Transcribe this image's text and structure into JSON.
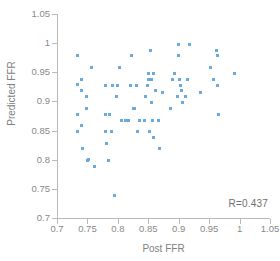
{
  "chart_data": {
    "type": "scatter",
    "title": "",
    "xlabel": "Post FFR",
    "ylabel": "Predicted FFR",
    "xlim": [
      0.7,
      1.05
    ],
    "ylim": [
      0.7,
      1.05
    ],
    "xticks": [
      "0.7",
      "0.75",
      "0.8",
      "0.85",
      "0.9",
      "0.95",
      "1",
      "1.05"
    ],
    "yticks": [
      "0.7",
      "0.75",
      "0.8",
      "0.85",
      "0.9",
      "0.95",
      "1",
      "1.05"
    ],
    "xtick_values": [
      0.7,
      0.75,
      0.8,
      0.85,
      0.9,
      0.95,
      1.0,
      1.05
    ],
    "ytick_values": [
      0.7,
      0.75,
      0.8,
      0.85,
      0.9,
      0.95,
      1.0,
      1.05
    ],
    "grid": false,
    "legend": null,
    "marker_color": "#6aabdd",
    "marker_shape": "square",
    "annotations": [
      {
        "text": "R=0.437",
        "position": "bottom-right"
      }
    ],
    "correlation_r": 0.437,
    "n_points": 84,
    "points": [
      [
        0.733,
        0.978
      ],
      [
        0.733,
        0.929
      ],
      [
        0.733,
        0.878
      ],
      [
        0.733,
        0.849
      ],
      [
        0.74,
        0.938
      ],
      [
        0.74,
        0.918
      ],
      [
        0.74,
        0.858
      ],
      [
        0.742,
        0.819
      ],
      [
        0.748,
        0.908
      ],
      [
        0.748,
        0.888
      ],
      [
        0.75,
        0.799
      ],
      [
        0.752,
        0.8
      ],
      [
        0.757,
        0.958
      ],
      [
        0.762,
        0.789
      ],
      [
        0.779,
        0.928
      ],
      [
        0.779,
        0.878
      ],
      [
        0.78,
        0.848
      ],
      [
        0.782,
        0.828
      ],
      [
        0.784,
        0.799
      ],
      [
        0.787,
        0.878
      ],
      [
        0.789,
        0.848
      ],
      [
        0.791,
        0.928
      ],
      [
        0.795,
        0.738
      ],
      [
        0.798,
        0.908
      ],
      [
        0.8,
        0.928
      ],
      [
        0.803,
        0.958
      ],
      [
        0.806,
        0.868
      ],
      [
        0.812,
        0.868
      ],
      [
        0.818,
        0.868
      ],
      [
        0.82,
        0.928
      ],
      [
        0.822,
        0.978
      ],
      [
        0.826,
        0.888
      ],
      [
        0.828,
        0.888
      ],
      [
        0.83,
        0.928
      ],
      [
        0.832,
        0.849
      ],
      [
        0.836,
        0.868
      ],
      [
        0.843,
        0.868
      ],
      [
        0.845,
        0.908
      ],
      [
        0.848,
        0.928
      ],
      [
        0.85,
        0.938
      ],
      [
        0.851,
        0.948
      ],
      [
        0.852,
        0.848
      ],
      [
        0.854,
        0.988
      ],
      [
        0.855,
        0.938
      ],
      [
        0.856,
        0.898
      ],
      [
        0.857,
        0.868
      ],
      [
        0.858,
        0.948
      ],
      [
        0.858,
        0.838
      ],
      [
        0.862,
        0.918
      ],
      [
        0.866,
        0.868
      ],
      [
        0.868,
        0.819
      ],
      [
        0.874,
        0.916
      ],
      [
        0.886,
        0.888
      ],
      [
        0.889,
        0.938
      ],
      [
        0.893,
        0.948
      ],
      [
        0.898,
        0.908
      ],
      [
        0.9,
        0.998
      ],
      [
        0.9,
        0.978
      ],
      [
        0.902,
        0.938
      ],
      [
        0.903,
        0.928
      ],
      [
        0.905,
        0.918
      ],
      [
        0.906,
        0.898
      ],
      [
        0.911,
        0.908
      ],
      [
        0.915,
        0.938
      ],
      [
        0.918,
        0.998
      ],
      [
        0.936,
        0.916
      ],
      [
        0.953,
        0.958
      ],
      [
        0.957,
        0.938
      ],
      [
        0.962,
        0.988
      ],
      [
        0.963,
        0.978
      ],
      [
        0.964,
        0.928
      ],
      [
        0.966,
        0.878
      ],
      [
        0.992,
        0.948
      ]
    ]
  }
}
